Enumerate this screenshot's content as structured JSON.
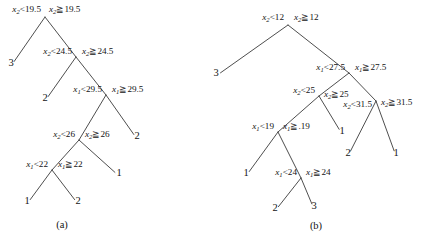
{
  "figure": {
    "background_color": "#ffffff",
    "line_color": "#3a3a3a",
    "text_color": "#141414"
  },
  "trees": [
    {
      "id": "tree-a",
      "caption": "(a)",
      "caption_x": 62,
      "caption_y": 228,
      "nodes": [
        {
          "id": "a-n1",
          "x": 45,
          "y": 17,
          "feature": "x",
          "subscript": "2",
          "threshold": "19.5",
          "left_label_text": "x₂<19.5",
          "right_label_text": "x₂≧19.5",
          "left_label_x": 41,
          "left_label_y": 12,
          "right_label_x": 49,
          "right_label_y": 12,
          "left_anchor": "end",
          "right_anchor": "start"
        },
        {
          "id": "a-n2",
          "x": 76,
          "y": 57,
          "feature": "x",
          "subscript": "2",
          "threshold": "24.5",
          "left_label_text": "x₂<24.5",
          "right_label_text": "x₂≧24.5",
          "left_label_x": 72,
          "left_label_y": 54,
          "right_label_x": 82,
          "right_label_y": 54,
          "left_anchor": "end",
          "right_anchor": "start"
        },
        {
          "id": "a-n3",
          "x": 106,
          "y": 95,
          "feature": "x",
          "subscript": "1",
          "threshold": "29.5",
          "left_label_text": "x₁<29.5",
          "right_label_text": "x₁≧29.5",
          "left_label_x": 102,
          "left_label_y": 92,
          "right_label_x": 112,
          "right_label_y": 92,
          "left_anchor": "end",
          "right_anchor": "start"
        },
        {
          "id": "a-n4",
          "x": 79,
          "y": 140,
          "feature": "x",
          "subscript": "2",
          "threshold": "26",
          "left_label_text": "x₂<26",
          "right_label_text": "x₂≧26",
          "left_label_x": 75,
          "left_label_y": 137,
          "right_label_x": 85,
          "right_label_y": 137,
          "left_anchor": "end",
          "right_anchor": "start"
        },
        {
          "id": "a-n5",
          "x": 52,
          "y": 170,
          "feature": "x",
          "subscript": "1",
          "threshold": "22",
          "left_label_text": "x₁<22",
          "right_label_text": "x₁≧22",
          "left_label_x": 48,
          "left_label_y": 167,
          "right_label_x": 58,
          "right_label_y": 167,
          "left_anchor": "end",
          "right_anchor": "start"
        }
      ],
      "leaves": [
        {
          "id": "a-l1",
          "label": "3",
          "x": 11,
          "y": 66
        },
        {
          "id": "a-l2",
          "label": "2",
          "x": 45,
          "y": 101
        },
        {
          "id": "a-l3",
          "label": "2",
          "x": 137,
          "y": 139
        },
        {
          "id": "a-l4",
          "label": "1",
          "x": 119,
          "y": 176
        },
        {
          "id": "a-l5",
          "label": "1",
          "x": 27,
          "y": 204
        },
        {
          "id": "a-l6",
          "label": "2",
          "x": 78,
          "y": 204
        }
      ],
      "edges": [
        {
          "from": "a-n1",
          "to": "a-l1"
        },
        {
          "from": "a-n1",
          "to": "a-n2"
        },
        {
          "from": "a-n2",
          "to": "a-l2"
        },
        {
          "from": "a-n2",
          "to": "a-n3"
        },
        {
          "from": "a-n3",
          "to": "a-n4"
        },
        {
          "from": "a-n3",
          "to": "a-l3"
        },
        {
          "from": "a-n4",
          "to": "a-n5"
        },
        {
          "from": "a-n4",
          "to": "a-l4"
        },
        {
          "from": "a-n5",
          "to": "a-l5"
        },
        {
          "from": "a-n5",
          "to": "a-l6"
        }
      ]
    },
    {
      "id": "tree-b",
      "caption": "(b)",
      "caption_x": 316,
      "caption_y": 229,
      "nodes": [
        {
          "id": "b-n1",
          "x": 288,
          "y": 25,
          "feature": "x",
          "subscript": "2",
          "threshold": "12",
          "left_label_text": "x₂<12",
          "right_label_text": "x₂≧12",
          "left_label_x": 284,
          "left_label_y": 20,
          "right_label_x": 294,
          "right_label_y": 20,
          "left_anchor": "end",
          "right_anchor": "start"
        },
        {
          "id": "b-n2",
          "x": 349,
          "y": 73,
          "feature": "x",
          "subscript": "1",
          "threshold": "27.5",
          "left_label_text": "x₁<27.5",
          "right_label_text": "x₁≧27.5",
          "left_label_x": 345,
          "left_label_y": 70,
          "right_label_x": 355,
          "right_label_y": 70,
          "left_anchor": "end",
          "right_anchor": "start"
        },
        {
          "id": "b-n3",
          "x": 319,
          "y": 96,
          "feature": "x",
          "subscript": "2",
          "threshold": "25",
          "left_label_text": "x₂<25",
          "right_label_text": "x₂≧25",
          "left_label_x": 315,
          "left_label_y": 93,
          "right_label_x": 324,
          "right_label_y": 97,
          "left_anchor": "end",
          "right_anchor": "start"
        },
        {
          "id": "b-n4",
          "x": 376,
          "y": 101,
          "feature": "x",
          "subscript": "2",
          "threshold": "31.5",
          "left_label_text": "x₂<31.5",
          "right_label_text": "x₂≧31.5",
          "left_label_x": 372,
          "left_label_y": 107,
          "right_label_x": 381,
          "right_label_y": 105,
          "left_anchor": "end",
          "right_anchor": "start"
        },
        {
          "id": "b-n5",
          "x": 278,
          "y": 132,
          "feature": "x",
          "subscript": "1",
          "threshold": "19",
          "left_label_text": "x₁<19",
          "right_label_text": "x₁≧.19",
          "left_label_x": 274,
          "left_label_y": 129,
          "right_label_x": 283,
          "right_label_y": 129,
          "left_anchor": "end",
          "right_anchor": "start"
        },
        {
          "id": "b-n6",
          "x": 301,
          "y": 178,
          "feature": "x",
          "subscript": "1",
          "threshold": "24",
          "left_label_text": "x₁<24",
          "right_label_text": "x₁≧24",
          "left_label_x": 297,
          "left_label_y": 175,
          "right_label_x": 306,
          "right_label_y": 175,
          "left_anchor": "end",
          "right_anchor": "start"
        }
      ],
      "leaves": [
        {
          "id": "b-l1",
          "label": "3",
          "x": 216,
          "y": 76
        },
        {
          "id": "b-l2",
          "label": "1",
          "x": 342,
          "y": 134
        },
        {
          "id": "b-l3",
          "label": "2",
          "x": 348,
          "y": 156
        },
        {
          "id": "b-l4",
          "label": "1",
          "x": 396,
          "y": 156
        },
        {
          "id": "b-l5",
          "label": "1",
          "x": 246,
          "y": 176
        },
        {
          "id": "b-l6",
          "label": "2",
          "x": 275,
          "y": 211
        },
        {
          "id": "b-l7",
          "label": "3",
          "x": 314,
          "y": 209
        }
      ],
      "edges": [
        {
          "from": "b-n1",
          "to": "b-l1"
        },
        {
          "from": "b-n1",
          "to": "b-n2"
        },
        {
          "from": "b-n2",
          "to": "b-n3"
        },
        {
          "from": "b-n2",
          "to": "b-n4"
        },
        {
          "from": "b-n3",
          "to": "b-n5"
        },
        {
          "from": "b-n3",
          "to": "b-l2"
        },
        {
          "from": "b-n4",
          "to": "b-l3"
        },
        {
          "from": "b-n4",
          "to": "b-l4"
        },
        {
          "from": "b-n5",
          "to": "b-l5"
        },
        {
          "from": "b-n5",
          "to": "b-n6"
        },
        {
          "from": "b-n6",
          "to": "b-l6"
        },
        {
          "from": "b-n6",
          "to": "b-l7"
        }
      ]
    }
  ]
}
